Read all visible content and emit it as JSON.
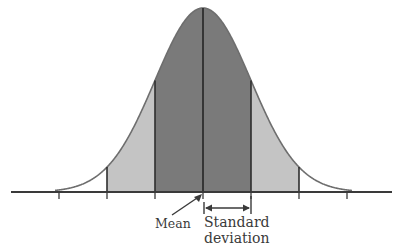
{
  "diagram": {
    "labels": {
      "mean": "Mean",
      "std_line1": "Standard",
      "std_line2": "deviation"
    },
    "colors": {
      "inner_band": "#7a7a7a",
      "outer_band": "#c4c4c4",
      "curve": "#6e6e6e",
      "lines": "#2e2e2e",
      "axis": "#3a3a3a",
      "background": "#ffffff"
    },
    "geometry": {
      "baseline_y": 192,
      "axis_x_start": 11,
      "axis_x_end": 392,
      "mean_x": 203,
      "peak_y": 8,
      "sigma_px": 48,
      "tick_sigmas": [
        -3,
        -2,
        -1,
        0,
        1,
        2,
        3
      ],
      "inner_band_sigmas": [
        -1,
        1
      ],
      "outer_band_sigmas": [
        -2,
        2
      ]
    }
  }
}
